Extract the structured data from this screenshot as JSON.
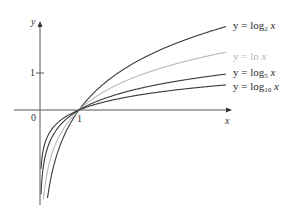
{
  "chart_data": {
    "type": "line",
    "title": "",
    "xlabel": "x",
    "ylabel": "y",
    "origin_label": "0",
    "x_ticks": [
      "1"
    ],
    "y_ticks": [
      "1"
    ],
    "grid": false,
    "legend_position": "inline-right",
    "x_range": [
      0,
      4.8
    ],
    "y_range": [
      -2.5,
      2.4
    ],
    "series": [
      {
        "name": "y = log₂ x",
        "prefix": "y = log",
        "base": "2",
        "suffix": "x",
        "base_value": 2,
        "color": "#3a3a3a"
      },
      {
        "name": "y = ln x",
        "prefix": "y = ln",
        "base": "",
        "suffix": "x",
        "base_value": 2.718281828,
        "color": "#b8b8b8"
      },
      {
        "name": "y = log₅ x",
        "prefix": "y = log",
        "base": "5",
        "suffix": "x",
        "base_value": 5,
        "color": "#3a3a3a"
      },
      {
        "name": "y = log₁₀ x",
        "prefix": "y = log",
        "base": "10",
        "suffix": "x",
        "base_value": 10,
        "color": "#3a3a3a"
      }
    ],
    "annotations": [
      "All curves pass through (1, 0)"
    ]
  }
}
